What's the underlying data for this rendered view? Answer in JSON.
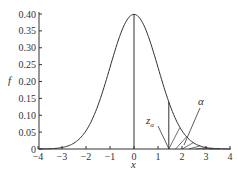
{
  "chart_data": {
    "type": "line",
    "title": "",
    "xlabel": "x",
    "ylabel": "f",
    "xlim": [
      -4,
      4
    ],
    "ylim": [
      0,
      0.4
    ],
    "grid": false,
    "x_ticks": [
      "−4",
      "−3",
      "−2",
      "−1",
      "0",
      "1",
      "2",
      "3",
      "4"
    ],
    "x_tick_values": [
      -4,
      -3,
      -2,
      -1,
      0,
      1,
      2,
      3,
      4
    ],
    "y_ticks": [
      "0",
      "0.05",
      "0.10",
      "0.15",
      "0.20",
      "0.25",
      "0.30",
      "0.35",
      "0.40"
    ],
    "y_tick_values": [
      0,
      0.05,
      0.1,
      0.15,
      0.2,
      0.25,
      0.3,
      0.35,
      0.4
    ],
    "series": [
      {
        "name": "standard normal pdf",
        "function": "f(x) = exp(-x^2/2)/sqrt(2*pi)",
        "x": [
          -4,
          -3,
          -2,
          -1,
          0,
          1,
          2,
          3,
          4
        ],
        "values": [
          0.0001,
          0.0044,
          0.054,
          0.242,
          0.399,
          0.242,
          0.054,
          0.0044,
          0.0001
        ]
      }
    ],
    "vertical_lines": [
      {
        "x": 0,
        "label": "mean"
      },
      {
        "x": 1.45,
        "label": "z_alpha"
      }
    ],
    "shaded_region": {
      "from": 1.45,
      "to": 4,
      "style": "hatched",
      "label": "α"
    },
    "annotations": [
      {
        "text": "z",
        "subscript": "α",
        "x": 1.1,
        "y": 0.06
      },
      {
        "text": "α",
        "x": 2.3,
        "y": 0.12
      }
    ]
  },
  "labels": {
    "xlabel": "x",
    "ylabel": "f",
    "z_main": "z",
    "z_sub": "α",
    "alpha": "α"
  }
}
